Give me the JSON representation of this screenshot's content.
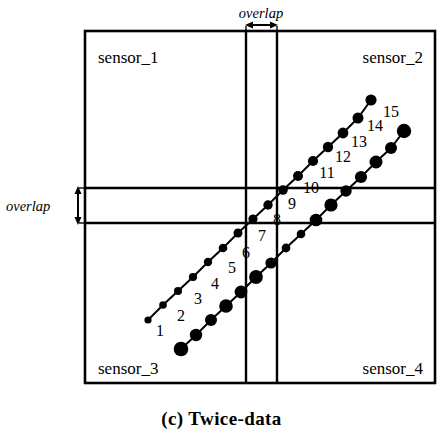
{
  "figure": {
    "caption": "(c) Twice-data",
    "overlap_label_top": "overlap",
    "overlap_label_left": "overlap",
    "quadrant_labels": {
      "top_left": "sensor_1",
      "top_right": "sensor_2",
      "bottom_left": "sensor_3",
      "bottom_right": "sensor_4"
    },
    "point_numbers": [
      "1",
      "2",
      "3",
      "4",
      "5",
      "6",
      "7",
      "8",
      "9",
      "10",
      "11",
      "12",
      "13",
      "14",
      "15"
    ],
    "colors": {
      "ink": "#000000",
      "background": "#ffffff"
    }
  },
  "chart_data": {
    "type": "scatter",
    "title": "(c) Twice-data",
    "xlabel": "",
    "ylabel": "",
    "grid": false,
    "legend": "none",
    "xlim": [
      85,
      435
    ],
    "ylim": [
      383,
      31
    ],
    "annotations": {
      "frame": {
        "x0": 85,
        "y0": 31,
        "x1": 435,
        "y1": 383
      },
      "vertical_overlap_band": {
        "x_left": 246,
        "x_right": 277
      },
      "horizontal_overlap_band": {
        "y_top": 188,
        "y_bottom": 223
      },
      "overlap_arrow_top": {
        "x0": 246,
        "x1": 277,
        "y": 24
      },
      "overlap_arrow_left": {
        "x": 98,
        "y0": 188,
        "y1": 223
      }
    },
    "number_labels": [
      {
        "label": "1",
        "x": 160,
        "y": 336
      },
      {
        "label": "2",
        "x": 181,
        "y": 321
      },
      {
        "label": "3",
        "x": 198,
        "y": 304
      },
      {
        "label": "4",
        "x": 215,
        "y": 289
      },
      {
        "label": "5",
        "x": 232,
        "y": 273
      },
      {
        "label": "6",
        "x": 246,
        "y": 258
      },
      {
        "label": "7",
        "x": 262,
        "y": 241
      },
      {
        "label": "8",
        "x": 277,
        "y": 225
      },
      {
        "label": "9",
        "x": 292,
        "y": 209
      },
      {
        "label": "10",
        "x": 311,
        "y": 193
      },
      {
        "label": "11",
        "x": 327,
        "y": 178
      },
      {
        "label": "12",
        "x": 343,
        "y": 162
      },
      {
        "label": "13",
        "x": 359,
        "y": 147
      },
      {
        "label": "14",
        "x": 375,
        "y": 131
      },
      {
        "label": "15",
        "x": 391,
        "y": 117
      }
    ],
    "series": [
      {
        "name": "upper-left-track",
        "marker": "filled-circle",
        "points": [
          {
            "x": 148,
            "y": 320,
            "r": 3.6
          },
          {
            "x": 163,
            "y": 305,
            "r": 3.8
          },
          {
            "x": 178,
            "y": 291,
            "r": 4.0
          },
          {
            "x": 193,
            "y": 277,
            "r": 4.1
          },
          {
            "x": 208,
            "y": 262,
            "r": 4.2
          },
          {
            "x": 223,
            "y": 248,
            "r": 4.3
          },
          {
            "x": 238,
            "y": 233,
            "r": 4.5
          },
          {
            "x": 253,
            "y": 219,
            "r": 4.6
          },
          {
            "x": 268,
            "y": 205,
            "r": 4.7
          },
          {
            "x": 283,
            "y": 190,
            "r": 4.8
          },
          {
            "x": 298,
            "y": 176,
            "r": 5.0
          },
          {
            "x": 313,
            "y": 161,
            "r": 5.1
          },
          {
            "x": 328,
            "y": 147,
            "r": 5.2
          },
          {
            "x": 343,
            "y": 133,
            "r": 5.4
          },
          {
            "x": 358,
            "y": 118,
            "r": 5.5
          },
          {
            "x": 371,
            "y": 100,
            "r": 5.6
          }
        ]
      },
      {
        "name": "lower-right-track",
        "marker": "filled-circle",
        "points": [
          {
            "x": 181,
            "y": 349,
            "r": 7.3
          },
          {
            "x": 196,
            "y": 335,
            "r": 6.2
          },
          {
            "x": 211,
            "y": 320,
            "r": 6.0
          },
          {
            "x": 226,
            "y": 306,
            "r": 6.8
          },
          {
            "x": 241,
            "y": 292,
            "r": 6.4
          },
          {
            "x": 256,
            "y": 277,
            "r": 6.9
          },
          {
            "x": 271,
            "y": 263,
            "r": 5.6
          },
          {
            "x": 286,
            "y": 248,
            "r": 4.4
          },
          {
            "x": 301,
            "y": 234,
            "r": 4.3
          },
          {
            "x": 316,
            "y": 220,
            "r": 6.3
          },
          {
            "x": 331,
            "y": 205,
            "r": 6.6
          },
          {
            "x": 346,
            "y": 191,
            "r": 5.7
          },
          {
            "x": 361,
            "y": 177,
            "r": 6.1
          },
          {
            "x": 376,
            "y": 162,
            "r": 6.5
          },
          {
            "x": 391,
            "y": 148,
            "r": 6.0
          },
          {
            "x": 404,
            "y": 131,
            "r": 7.2
          }
        ]
      }
    ]
  }
}
